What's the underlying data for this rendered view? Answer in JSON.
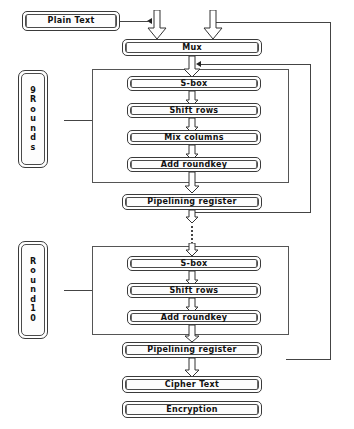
{
  "diagram": {
    "nodes": {
      "plain_text": "Plain Text",
      "mux": "Mux",
      "sbox_1": "S-box",
      "shift_rows_1": "Shift rows",
      "mix_columns_1": "Mix columns",
      "add_roundkey_1": "Add roundkey",
      "pipelining_register_1": "Pipelining register",
      "sbox_2": "S-box",
      "shift_rows_2": "Shift rows",
      "add_roundkey_2": "Add roundkey",
      "pipelining_register_2": "Pipelining register",
      "cipher_text": "Cipher Text",
      "encryption": "Encryption"
    },
    "labels": {
      "nine_rounds": [
        "9",
        "R",
        "o",
        "u",
        "n",
        "d",
        "s"
      ],
      "nine_rounds_text": "9 Rounds",
      "round_ten": [
        "R",
        "o",
        "u",
        "n",
        "d",
        "1",
        "0"
      ],
      "round_ten_text": "Round 10"
    },
    "colors": {
      "stroke": "#3a3a3a",
      "arrow": "#222222",
      "background": "#ffffff",
      "text": "#111111"
    },
    "edges": [
      {
        "from": "plain_text",
        "to": "mux",
        "style": "line-then-block-arrow"
      },
      {
        "from": "feedback_outer",
        "to": "mux",
        "style": "block-arrow"
      },
      {
        "from": "mux",
        "to": "sbox_1",
        "style": "block-arrow"
      },
      {
        "from": "sbox_1",
        "to": "shift_rows_1",
        "style": "block-arrow"
      },
      {
        "from": "shift_rows_1",
        "to": "mix_columns_1",
        "style": "block-arrow"
      },
      {
        "from": "mix_columns_1",
        "to": "add_roundkey_1",
        "style": "block-arrow"
      },
      {
        "from": "add_roundkey_1",
        "to": "pipelining_register_1",
        "style": "block-arrow"
      },
      {
        "from": "pipelining_register_1",
        "to": "sbox_2",
        "style": "dotted"
      },
      {
        "from": "sbox_2",
        "to": "shift_rows_2",
        "style": "block-arrow"
      },
      {
        "from": "shift_rows_2",
        "to": "add_roundkey_2",
        "style": "block-arrow"
      },
      {
        "from": "add_roundkey_2",
        "to": "pipelining_register_2",
        "style": "block-arrow"
      },
      {
        "from": "pipelining_register_2",
        "to": "cipher_text",
        "style": "block-arrow"
      },
      {
        "from": "pipelining_register_1",
        "to": "mux_round_input",
        "style": "feedback-loop"
      },
      {
        "from": "pipelining_register_2",
        "to": "mux",
        "style": "feedback-loop-outer"
      },
      {
        "from": "nine_rounds",
        "to": "round_group_1",
        "style": "line"
      },
      {
        "from": "round_ten",
        "to": "round_group_2",
        "style": "line"
      }
    ]
  }
}
